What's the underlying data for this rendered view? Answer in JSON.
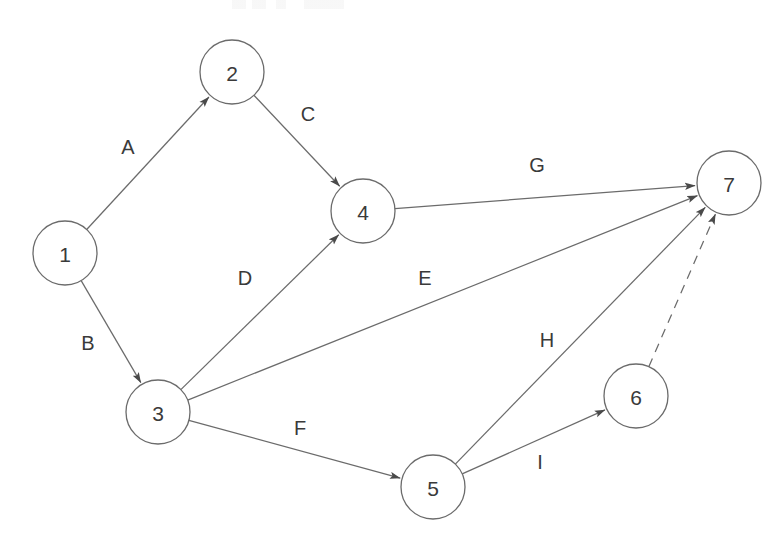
{
  "diagram": {
    "canvas": {
      "width": 782,
      "height": 539,
      "background": "#ffffff"
    },
    "colors": {
      "stroke": "#6b6b6b",
      "node_fill": "#ffffff",
      "text": "#3a3a3a"
    },
    "node_radius": 32,
    "nodes": [
      {
        "id": "n1",
        "label": "1",
        "x": 65,
        "y": 253
      },
      {
        "id": "n2",
        "label": "2",
        "x": 232,
        "y": 72
      },
      {
        "id": "n3",
        "label": "3",
        "x": 158,
        "y": 412
      },
      {
        "id": "n4",
        "label": "4",
        "x": 363,
        "y": 211
      },
      {
        "id": "n5",
        "label": "5",
        "x": 433,
        "y": 487
      },
      {
        "id": "n6",
        "label": "6",
        "x": 636,
        "y": 396
      },
      {
        "id": "n7",
        "label": "7",
        "x": 729,
        "y": 183
      }
    ],
    "edges": [
      {
        "id": "eA",
        "label": "A",
        "from": "n1",
        "to": "n2",
        "style": "solid",
        "arrow": true,
        "label_x": 128,
        "label_y": 147
      },
      {
        "id": "eB",
        "label": "B",
        "from": "n1",
        "to": "n3",
        "style": "solid",
        "arrow": true,
        "label_x": 88,
        "label_y": 343
      },
      {
        "id": "eC",
        "label": "C",
        "from": "n2",
        "to": "n4",
        "style": "solid",
        "arrow": true,
        "label_x": 308,
        "label_y": 114
      },
      {
        "id": "eD",
        "label": "D",
        "from": "n3",
        "to": "n4",
        "style": "solid",
        "arrow": true,
        "label_x": 245,
        "label_y": 278
      },
      {
        "id": "eE",
        "label": "E",
        "from": "n3",
        "to": "n7",
        "style": "solid",
        "arrow": true,
        "label_x": 425,
        "label_y": 278
      },
      {
        "id": "eF",
        "label": "F",
        "from": "n3",
        "to": "n5",
        "style": "solid",
        "arrow": true,
        "label_x": 300,
        "label_y": 428
      },
      {
        "id": "eG",
        "label": "G",
        "from": "n4",
        "to": "n7",
        "style": "solid",
        "arrow": true,
        "label_x": 537,
        "label_y": 165
      },
      {
        "id": "eH",
        "label": "H",
        "from": "n5",
        "to": "n7",
        "style": "solid",
        "arrow": true,
        "label_x": 547,
        "label_y": 340
      },
      {
        "id": "eI",
        "label": "I",
        "from": "n5",
        "to": "n6",
        "style": "solid",
        "arrow": true,
        "label_x": 540,
        "label_y": 462
      },
      {
        "id": "eDashed",
        "label": "",
        "from": "n6",
        "to": "n7",
        "style": "dashed",
        "arrow": true,
        "label_x": 0,
        "label_y": 0
      }
    ]
  }
}
